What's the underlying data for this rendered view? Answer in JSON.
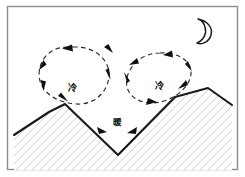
{
  "figure": {
    "background_color": "#ffffff",
    "frame_color": "#8d8d8d",
    "width": 245,
    "height": 177
  },
  "sky": {
    "moon": {
      "icon": "crescent-moon-icon",
      "label": "",
      "cx": 203,
      "cy": 28,
      "r": 9.5,
      "color": "#1d1d1d"
    }
  },
  "terrain": {
    "outline_color": "#1a1a1a",
    "hatch_color": "#c8c8c8",
    "profile_points": "14,135 49,112 65,104 118,155 175,97 208,88 232,105",
    "label": "valley terrain profile"
  },
  "circulations": [
    {
      "id": "left-loop",
      "label": "left slope circulation",
      "direction": "counterclockwise",
      "cx": 73,
      "cy": 75,
      "rx": 36,
      "ry": 27,
      "rotation": -8,
      "inner_symbol": "冷",
      "inner_symbol_name": "cold-air-label",
      "symbol_x": 72,
      "symbol_y": 88
    },
    {
      "id": "right-loop",
      "label": "right slope circulation",
      "direction": "clockwise",
      "cx": 157,
      "cy": 80,
      "rx": 35,
      "ry": 25,
      "rotation": -22,
      "inner_symbol": "冷",
      "inner_symbol_name": "cold-air-label",
      "symbol_x": 159,
      "symbol_y": 86
    }
  ],
  "annotations": {
    "valley_bottom": {
      "symbol": "暖",
      "name": "warm-air-label",
      "x": 117,
      "y": 122
    }
  },
  "legend_colors": {
    "ink": "#1a1a1a",
    "dash": "#2b2b2b",
    "hatch": "#c8c8c8",
    "frame": "#8d8d8d"
  }
}
